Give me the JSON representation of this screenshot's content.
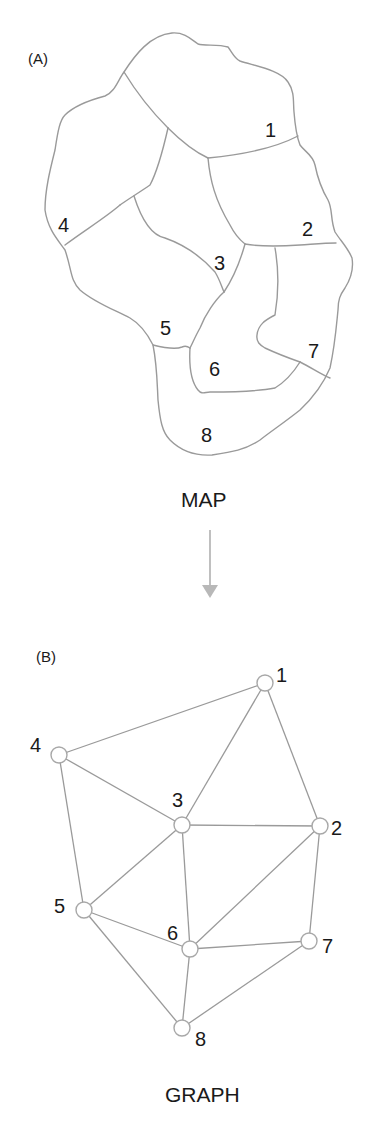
{
  "panel_a": {
    "tag": "(A)",
    "caption": "MAP",
    "regions": [
      {
        "id": "1",
        "label": "1",
        "x": 272,
        "y": 136
      },
      {
        "id": "2",
        "label": "2",
        "x": 309,
        "y": 234
      },
      {
        "id": "3",
        "label": "3",
        "x": 222,
        "y": 273
      },
      {
        "id": "4",
        "label": "4",
        "x": 66,
        "y": 232
      },
      {
        "id": "5",
        "label": "5",
        "x": 168,
        "y": 335
      },
      {
        "id": "6",
        "label": "6",
        "x": 216,
        "y": 375
      },
      {
        "id": "7",
        "label": "7",
        "x": 314,
        "y": 356
      },
      {
        "id": "8",
        "label": "8",
        "x": 208,
        "y": 441
      }
    ]
  },
  "arrow": {
    "direction": "down",
    "color": "#b0b0b0"
  },
  "panel_b": {
    "tag": "(B)",
    "caption": "GRAPH",
    "nodes": [
      {
        "id": "1",
        "label": "1",
        "x": 265,
        "y": 683
      },
      {
        "id": "2",
        "label": "2",
        "x": 320,
        "y": 826
      },
      {
        "id": "3",
        "label": "3",
        "x": 182,
        "y": 825
      },
      {
        "id": "4",
        "label": "4",
        "x": 59,
        "y": 755
      },
      {
        "id": "5",
        "label": "5",
        "x": 84,
        "y": 910
      },
      {
        "id": "6",
        "label": "6",
        "x": 190,
        "y": 949
      },
      {
        "id": "7",
        "label": "7",
        "x": 309,
        "y": 941
      },
      {
        "id": "8",
        "label": "8",
        "x": 182,
        "y": 1028
      }
    ],
    "edges": [
      [
        "1",
        "4"
      ],
      [
        "1",
        "3"
      ],
      [
        "1",
        "2"
      ],
      [
        "4",
        "3"
      ],
      [
        "4",
        "5"
      ],
      [
        "3",
        "2"
      ],
      [
        "3",
        "5"
      ],
      [
        "3",
        "6"
      ],
      [
        "2",
        "6"
      ],
      [
        "2",
        "7"
      ],
      [
        "5",
        "6"
      ],
      [
        "5",
        "8"
      ],
      [
        "6",
        "7"
      ],
      [
        "6",
        "8"
      ],
      [
        "7",
        "8"
      ]
    ]
  },
  "colors": {
    "line": "#9a9a9a",
    "text": "#1a1a1a",
    "node_fill": "#ffffff"
  }
}
